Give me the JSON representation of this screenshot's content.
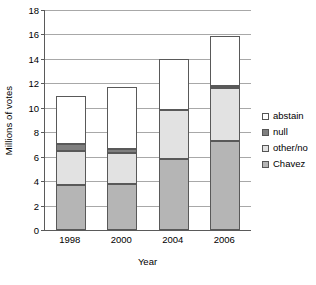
{
  "chart_data": {
    "type": "bar",
    "subtype": "stacked-bar",
    "title": "",
    "xlabel": "Year",
    "ylabel": "Millions of votes",
    "categories": [
      "1998",
      "2000",
      "2004",
      "2006"
    ],
    "ylim": [
      0,
      18
    ],
    "yticks": [
      0,
      2,
      4,
      6,
      8,
      10,
      12,
      14,
      16,
      18
    ],
    "grid": "horizontal",
    "legend_position": "right",
    "stack_order_bottom_to_top": [
      "Chavez",
      "other/no",
      "null",
      "abstain"
    ],
    "series": [
      {
        "name": "Chavez",
        "color": "#b5b5b5",
        "values": [
          3.7,
          3.75,
          5.8,
          7.3
        ]
      },
      {
        "name": "other/no",
        "color": "#e2e2e2",
        "values": [
          2.8,
          2.55,
          4.0,
          4.35
        ]
      },
      {
        "name": "null",
        "color": "#7f7f7f",
        "values": [
          0.5,
          0.3,
          0.0,
          0.15
        ]
      },
      {
        "name": "abstain",
        "color": "#ffffff",
        "values": [
          4.0,
          5.1,
          4.2,
          4.1
        ]
      }
    ],
    "totals": [
      11.0,
      11.7,
      14.0,
      15.9
    ]
  },
  "legend": {
    "items": [
      {
        "label": "abstain",
        "color": "#ffffff"
      },
      {
        "label": "null",
        "color": "#7f7f7f"
      },
      {
        "label": "other/no",
        "color": "#e2e2e2"
      },
      {
        "label": "Chavez",
        "color": "#b5b5b5"
      }
    ]
  },
  "axis": {
    "y_title": "Millions of votes",
    "x_title": "Year",
    "y_tick_labels": [
      "0",
      "2",
      "4",
      "6",
      "8",
      "10",
      "12",
      "14",
      "16",
      "18"
    ],
    "x_tick_labels": [
      "1998",
      "2000",
      "2004",
      "2006"
    ]
  }
}
